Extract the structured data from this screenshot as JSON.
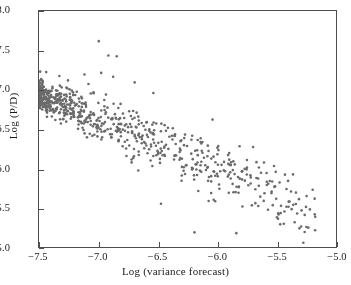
{
  "chart_data": {
    "type": "scatter",
    "title": "",
    "xlabel": "Log (variance forecast)",
    "ylabel": "Log (P/D)",
    "xlim": [
      -7.5,
      -5.0
    ],
    "ylim": [
      5.0,
      8.0
    ],
    "xticks": [
      "-7.5",
      "-7.0",
      "-6.5",
      "-6.0",
      "-5.5",
      "-5.0"
    ],
    "xtick_values": [
      -7.5,
      -7.0,
      -6.5,
      -6.0,
      -5.5,
      -5.0
    ],
    "yticks": [
      "8.0",
      "7.5",
      "7.0",
      "6.5",
      "6.0",
      "5.5",
      "5.0"
    ],
    "ytick_values": [
      8.0,
      7.5,
      7.0,
      6.5,
      6.0,
      5.5,
      5.0
    ],
    "grid": false,
    "legend": null,
    "marker": {
      "shape": "circle",
      "color": "#6b6b6b",
      "size_px": 2.6,
      "count": 742
    },
    "frame_color": "#4e4e4e",
    "background": "#ffffff",
    "relationship": "negative",
    "trend": {
      "intercept_at_x_-7.5": 6.95,
      "slope_per_unit_x": -0.62,
      "spread_sigma_left": 0.09,
      "spread_sigma_right": 0.24
    },
    "outliers": [
      {
        "x": -7.0,
        "y": 7.62
      },
      {
        "x": -6.92,
        "y": 7.44
      },
      {
        "x": -6.85,
        "y": 7.43
      },
      {
        "x": -7.44,
        "y": 7.23
      },
      {
        "x": -7.33,
        "y": 7.18
      },
      {
        "x": -7.12,
        "y": 7.2
      },
      {
        "x": -6.98,
        "y": 7.22
      },
      {
        "x": -6.88,
        "y": 7.17
      },
      {
        "x": -6.7,
        "y": 7.1
      },
      {
        "x": -6.62,
        "y": 6.27
      },
      {
        "x": -6.67,
        "y": 5.99
      },
      {
        "x": -6.48,
        "y": 5.57
      },
      {
        "x": -6.2,
        "y": 5.21
      },
      {
        "x": -5.85,
        "y": 5.2
      },
      {
        "x": -5.65,
        "y": 5.66
      },
      {
        "x": -5.5,
        "y": 5.45
      },
      {
        "x": -5.78,
        "y": 6.01
      },
      {
        "x": -5.72,
        "y": 5.55
      }
    ],
    "points_note": "742 observations rendered from a seeded generator matching the printed density profile"
  }
}
